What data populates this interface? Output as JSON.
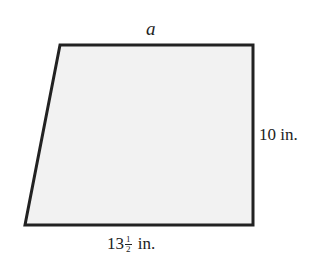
{
  "diagram": {
    "shape": "trapezoid",
    "fill_color": "#f2f2f2",
    "stroke_color": "#222222",
    "vertices": [
      [
        60,
        45
      ],
      [
        253,
        45
      ],
      [
        253,
        225
      ],
      [
        25,
        225
      ]
    ],
    "labels": {
      "top": "a",
      "right": "10 in.",
      "bottom_whole": "13",
      "bottom_frac_num": "1",
      "bottom_frac_den": "2",
      "bottom_unit": "in."
    }
  }
}
